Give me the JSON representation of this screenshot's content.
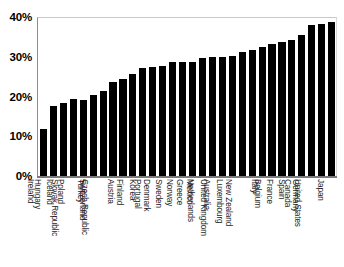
{
  "chart_data": {
    "type": "bar",
    "title": "",
    "subtitle": "",
    "xlabel": "",
    "ylabel": "",
    "ylim": [
      0,
      40
    ],
    "yticks": [
      0,
      10,
      20,
      30,
      40
    ],
    "ytick_labels": [
      "0%",
      "10%",
      "20%",
      "30%",
      "40%"
    ],
    "grid": false,
    "legend": false,
    "legend_position": "none",
    "bar_color": "#000000",
    "background_color": "#ffffff",
    "orientation": "vertical",
    "categories": [
      "Ireland",
      "Hungary",
      "Iceland",
      "Poland",
      "Slovak Republic",
      "Turkey",
      "Switzerland",
      "Czech Republic",
      "Austria",
      "Finland",
      "Korea",
      "Portugal",
      "Denmark",
      "Sweden",
      "Norway",
      "Greece",
      "Mexico",
      "Netherlands",
      "Australia",
      "United Kingdom",
      "Luxembourg",
      "New Zealand",
      "Italy",
      "Belgium",
      "France",
      "Spain",
      "Canada",
      "Germany",
      "United States",
      "Japan"
    ],
    "values": [
      11.8,
      17.7,
      18.4,
      19.3,
      19.2,
      20.3,
      21.3,
      23.6,
      24.5,
      25.6,
      27.2,
      27.3,
      27.7,
      28.6,
      28.7,
      28.8,
      29.8,
      29.9,
      30.0,
      30.1,
      31.3,
      31.8,
      32.5,
      33.3,
      33.6,
      34.2,
      35.5,
      38.1,
      38.2,
      38.8
    ]
  }
}
